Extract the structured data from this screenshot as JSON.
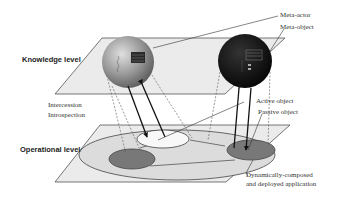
{
  "diagram": {
    "levels": {
      "knowledge": "Knowledge level",
      "operational": "Operational level"
    },
    "relations": {
      "intercession": "Intercession",
      "introspection": "Introspection"
    },
    "callouts": {
      "meta_actor": "Meta-actor",
      "meta_object": "Meta-object",
      "active_object": "Active object",
      "passive_object": "Passive object",
      "application_line1": "Dynamically-composed",
      "application_line2": "and deployed application"
    },
    "colors": {
      "plane_fill": "#e9e9e9",
      "plane_stroke": "#555555",
      "meta_actor_sphere": "#8a8a8a",
      "meta_object_sphere": "#111111",
      "application_ellipse": "#dedede",
      "active_object_ellipse": "#f7f7f7",
      "passive_object_ellipse": "#7a7a7a"
    }
  }
}
